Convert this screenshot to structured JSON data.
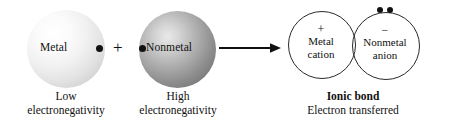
{
  "figure": {
    "reactants": [
      {
        "id": "metal",
        "sphere_label": "Metal",
        "caption_line1": "Low",
        "caption_line2": "electronegativity",
        "shade": "light",
        "electron_icon": "electron-dot"
      },
      {
        "id": "nonmetal",
        "sphere_label": "Nonmetal",
        "caption_line1": "High",
        "caption_line2": "electronegativity",
        "shade": "dark",
        "electron_icon": "electron-dot"
      }
    ],
    "operator": "+",
    "arrow": {
      "icon": "right-arrow-icon",
      "direction": "right"
    },
    "products": [
      {
        "id": "cation",
        "charge": "+",
        "line1": "Metal",
        "line2": "cation"
      },
      {
        "id": "anion",
        "charge": "−",
        "line1": "Nonmetal",
        "line2": "anion",
        "lone_pair_icon": "electron-pair-dots"
      }
    ],
    "product_caption": {
      "bond_title": "Ionic bond",
      "subtitle": "Electron transferred"
    },
    "colors": {
      "ink": "#111111",
      "outline": "#2a2a2a",
      "background": "#ffffff"
    }
  }
}
